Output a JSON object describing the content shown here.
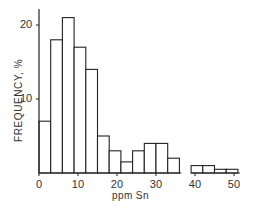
{
  "chart_data": {
    "type": "bar",
    "subtype": "histogram",
    "title": "",
    "xlabel": "ppm Sn",
    "ylabel": "FREQUENCY, %",
    "xlim": [
      0,
      52
    ],
    "ylim": [
      0,
      22
    ],
    "xticks": [
      0,
      10,
      20,
      30,
      40,
      50
    ],
    "yticks": [
      10,
      20
    ],
    "grid": false,
    "legend": null,
    "bin_width": 3,
    "bins": [
      {
        "from": 0,
        "to": 3,
        "value": 7
      },
      {
        "from": 3,
        "to": 6,
        "value": 18
      },
      {
        "from": 6,
        "to": 9,
        "value": 21
      },
      {
        "from": 9,
        "to": 12,
        "value": 17
      },
      {
        "from": 12,
        "to": 15,
        "value": 14
      },
      {
        "from": 15,
        "to": 18,
        "value": 5
      },
      {
        "from": 18,
        "to": 21,
        "value": 3
      },
      {
        "from": 21,
        "to": 24,
        "value": 1.5
      },
      {
        "from": 24,
        "to": 27,
        "value": 3
      },
      {
        "from": 27,
        "to": 30,
        "value": 4
      },
      {
        "from": 30,
        "to": 33,
        "value": 4
      },
      {
        "from": 33,
        "to": 36,
        "value": 2
      },
      {
        "from": 36,
        "to": 39,
        "value": 0
      },
      {
        "from": 39,
        "to": 42,
        "value": 1
      },
      {
        "from": 42,
        "to": 45,
        "value": 1
      },
      {
        "from": 45,
        "to": 48,
        "value": 0.5
      },
      {
        "from": 48,
        "to": 51,
        "value": 0.5
      }
    ],
    "categories": [
      "0-3",
      "3-6",
      "6-9",
      "9-12",
      "12-15",
      "15-18",
      "18-21",
      "21-24",
      "24-27",
      "27-30",
      "30-33",
      "33-36",
      "36-39",
      "39-42",
      "42-45",
      "45-48",
      "48-51"
    ],
    "values": [
      7,
      18,
      21,
      17,
      14,
      5,
      3,
      1.5,
      3,
      4,
      4,
      2,
      0,
      1,
      1,
      0.5,
      0.5
    ]
  },
  "labels": {
    "y_axis": "FREQUENCY, %",
    "x_axis": "ppm Sn"
  }
}
